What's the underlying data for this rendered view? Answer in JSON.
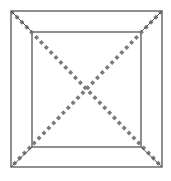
{
  "diagram": {
    "colors": {
      "background": "#ffffff",
      "solid_line": "#555555",
      "dotted_line": "#7a7a7a"
    },
    "outer_square": {
      "x1": 11,
      "y1": 11,
      "x2": 162,
      "y2": 167
    },
    "inner_square": {
      "x1": 32,
      "y1": 32,
      "x2": 141,
      "y2": 147
    },
    "diagonals": [
      {
        "name": "diagonal-tl-br",
        "from": [
          11,
          11
        ],
        "to": [
          162,
          167
        ]
      },
      {
        "name": "diagonal-tr-bl",
        "from": [
          162,
          11
        ],
        "to": [
          11,
          167
        ]
      }
    ]
  }
}
